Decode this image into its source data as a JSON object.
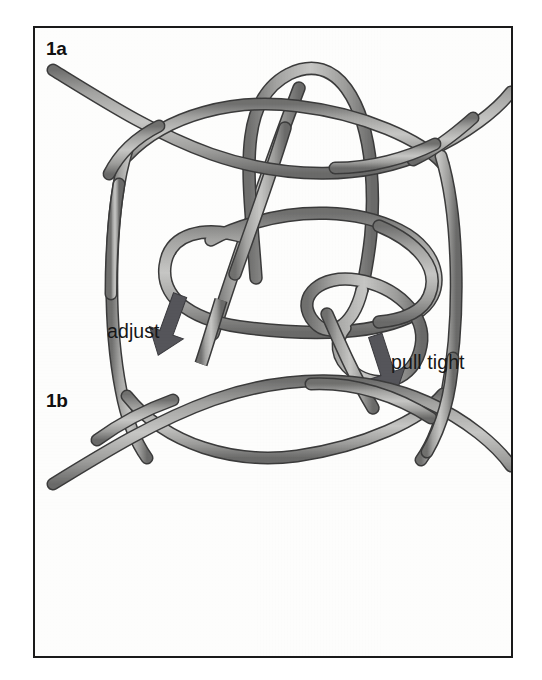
{
  "figure": {
    "kind": "knot-tying-instruction-plate",
    "background_color": "#ffffff",
    "plate_background_color": "#fdfdfc",
    "frame_color": "#1a1a1a",
    "rope_fill_color": "#9a9a99",
    "rope_outline_color": "#3b3b3b",
    "rope_highlight_color": "#cfcfce",
    "arrow_color": "#55555a",
    "label_color": "#101010",
    "callout_color": "#171717"
  },
  "panels": [
    {
      "id": "1a",
      "label": "1a",
      "description": "Loop of cord crossed over itself forming a slipped overhand configuration with a long tail running down to the lower left and a second tail running down to the lower right.",
      "callouts": [
        {
          "id": "adjust",
          "text": "adjust",
          "arrow_direction": "down-left"
        },
        {
          "id": "pull-tight",
          "text": "pull tight",
          "arrow_direction": "down-right"
        }
      ]
    },
    {
      "id": "1b",
      "label": "1b",
      "description": "Finished symmetric knot: two cords each forming a flattened lens shape, crossing each other at four points to create a closed central barrel."
    }
  ],
  "labels": {
    "panel_1a": "1a",
    "panel_1b": "1b"
  },
  "callouts": {
    "adjust": "adjust",
    "pull_tight": "pull tight"
  }
}
